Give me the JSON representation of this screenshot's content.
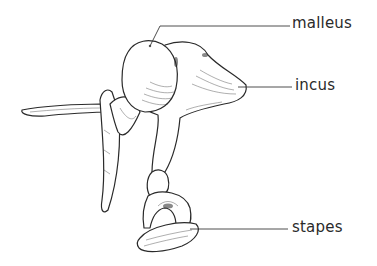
{
  "diagram": {
    "labels": [
      {
        "id": "malleus",
        "text": "malleus"
      },
      {
        "id": "incus",
        "text": "incus"
      },
      {
        "id": "stapes",
        "text": "stapes"
      }
    ],
    "colors": {
      "ink": "#2a2a2a",
      "background": "#ffffff"
    }
  }
}
